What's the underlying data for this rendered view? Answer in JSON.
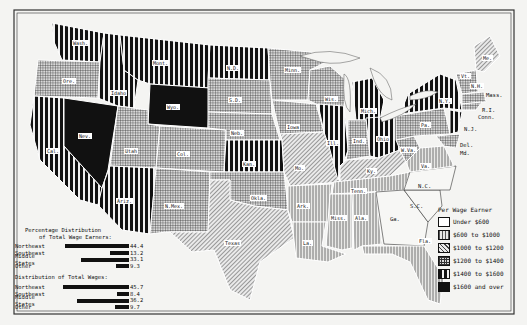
{
  "map": {
    "title": "Per Wage Earner",
    "frame_color": "#333333",
    "background": "#f4f4f2"
  },
  "legend": {
    "title": "Per Wage Earner",
    "items": [
      {
        "label": "Under $600",
        "pattern": "blank"
      },
      {
        "label": "$600 to $1000",
        "pattern": "light-vertical"
      },
      {
        "label": "$1000 to $1200",
        "pattern": "diagonal"
      },
      {
        "label": "$1200 to $1400",
        "pattern": "grid"
      },
      {
        "label": "$1400 to $1600",
        "pattern": "heavy-vertical"
      },
      {
        "label": "$1600 and over",
        "pattern": "solid"
      }
    ]
  },
  "distribution": {
    "earners_title_line1": "Percentage Distribution",
    "earners_title_line2": "of Total Wage Earners:",
    "earners": [
      {
        "region": "Northeast",
        "value": "44.4"
      },
      {
        "region": "Southeast",
        "value": "13.2"
      },
      {
        "region": "Middle States",
        "value": "33.1"
      },
      {
        "region": "Other",
        "value": "9.3"
      }
    ],
    "wages_title": "Distribution of Total Wages:",
    "wages": [
      {
        "region": "Northeast",
        "value": "45.7"
      },
      {
        "region": "Southeast",
        "value": "8.4"
      },
      {
        "region": "Middle States",
        "value": "36.2"
      },
      {
        "region": "Other",
        "value": "9.7"
      }
    ]
  },
  "states": [
    {
      "abbr": "Wash.",
      "class": "$1400 to $1600"
    },
    {
      "abbr": "Ore.",
      "class": "$1200 to $1400"
    },
    {
      "abbr": "Cal.",
      "class": "$1400 to $1600"
    },
    {
      "abbr": "Nev.",
      "class": "$1600 and over"
    },
    {
      "abbr": "Idaho",
      "class": "$1400 to $1600"
    },
    {
      "abbr": "Mont.",
      "class": "$1400 to $1600"
    },
    {
      "abbr": "Wyo.",
      "class": "$1600 and over"
    },
    {
      "abbr": "Utah",
      "class": "$1200 to $1400"
    },
    {
      "abbr": "Col.",
      "class": "$1200 to $1400"
    },
    {
      "abbr": "Ariz.",
      "class": "$1400 to $1600"
    },
    {
      "abbr": "N.Mex.",
      "class": "$1200 to $1400"
    },
    {
      "abbr": "N.D.",
      "class": "$1400 to $1600"
    },
    {
      "abbr": "S.D.",
      "class": "$1200 to $1400"
    },
    {
      "abbr": "Neb.",
      "class": "$1200 to $1400"
    },
    {
      "abbr": "Kan.",
      "class": "$1400 to $1600"
    },
    {
      "abbr": "Okla.",
      "class": "$1200 to $1400"
    },
    {
      "abbr": "Texas",
      "class": "$1000 to $1200"
    },
    {
      "abbr": "Minn.",
      "class": "$1200 to $1400"
    },
    {
      "abbr": "Iowa",
      "class": "$1200 to $1400"
    },
    {
      "abbr": "Mo.",
      "class": "$1000 to $1200"
    },
    {
      "abbr": "Ark.",
      "class": "$600 to $1000"
    },
    {
      "abbr": "La.",
      "class": "$600 to $1000"
    },
    {
      "abbr": "Wis.",
      "class": "$1200 to $1400"
    },
    {
      "abbr": "Ill.",
      "class": "$1400 to $1600"
    },
    {
      "abbr": "Mich.",
      "class": "$1400 to $1600"
    },
    {
      "abbr": "Ind.",
      "class": "$1200 to $1400"
    },
    {
      "abbr": "Ohio",
      "class": "$1400 to $1600"
    },
    {
      "abbr": "Ky.",
      "class": "$1000 to $1200"
    },
    {
      "abbr": "Tenn.",
      "class": "$600 to $1000"
    },
    {
      "abbr": "Miss.",
      "class": "$600 to $1000"
    },
    {
      "abbr": "Ala.",
      "class": "$600 to $1000"
    },
    {
      "abbr": "Ga.",
      "class": "Under $600"
    },
    {
      "abbr": "Fla.",
      "class": "$600 to $1000"
    },
    {
      "abbr": "S.C.",
      "class": "Under $600"
    },
    {
      "abbr": "N.C.",
      "class": "Under $600"
    },
    {
      "abbr": "Va.",
      "class": "$600 to $1000"
    },
    {
      "abbr": "W.Va.",
      "class": "$1200 to $1400"
    },
    {
      "abbr": "Pa.",
      "class": "$1200 to $1400"
    },
    {
      "abbr": "N.Y.",
      "class": "$1400 to $1600"
    },
    {
      "abbr": "Vt.",
      "class": "$1000 to $1200"
    },
    {
      "abbr": "N.H.",
      "class": "$1200 to $1400"
    },
    {
      "abbr": "Me.",
      "class": "$1000 to $1200"
    },
    {
      "abbr": "Mass.",
      "class": "$1200 to $1400"
    },
    {
      "abbr": "R.I.",
      "class": "$1200 to $1400"
    },
    {
      "abbr": "Conn.",
      "class": "$1200 to $1400"
    },
    {
      "abbr": "N.J.",
      "class": "$1400 to $1600"
    },
    {
      "abbr": "Del.",
      "class": "$1200 to $1400"
    },
    {
      "abbr": "Md.",
      "class": "$1200 to $1400"
    }
  ]
}
